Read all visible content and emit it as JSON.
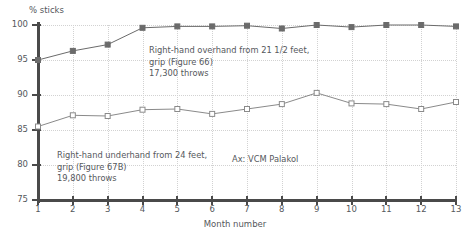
{
  "chart_data": {
    "type": "line",
    "title": "",
    "xlabel": "Month number",
    "ylabel": "% sticks",
    "ylim": [
      75,
      100
    ],
    "xlim": [
      1,
      13
    ],
    "yticks": [
      75,
      80,
      85,
      90,
      95,
      100
    ],
    "xticks": [
      1,
      2,
      3,
      4,
      5,
      6,
      7,
      8,
      9,
      10,
      11,
      12,
      13
    ],
    "grid": true,
    "legend": "none",
    "x": [
      1,
      2,
      3,
      4,
      5,
      6,
      7,
      8,
      9,
      10,
      11,
      12,
      13
    ],
    "series": [
      {
        "name": "Right-hand overhand from 21 1/2 feet",
        "marker": "filled-square",
        "color": "#6b6b6b",
        "values": [
          95.0,
          96.3,
          97.2,
          99.6,
          99.8,
          99.8,
          99.9,
          99.5,
          100.0,
          99.7,
          100.0,
          100.0,
          99.8
        ]
      },
      {
        "name": "Right-hand underhand from 24 feet",
        "marker": "open-square",
        "color": "#8a8a8a",
        "values": [
          85.5,
          87.1,
          87.0,
          87.9,
          88.0,
          87.3,
          88.0,
          88.7,
          90.3,
          88.8,
          88.7,
          88.0,
          89.0
        ]
      }
    ],
    "annotations": [
      {
        "id": "overhand",
        "lines": [
          "Right-hand overhand from 21 1/2 feet,",
          "grip (Figure 66)",
          "17,300 throws"
        ]
      },
      {
        "id": "underhand",
        "lines": [
          "Right-hand underhand from 24 feet,",
          "grip (Figure 67B)",
          "19,800 throws"
        ]
      },
      {
        "id": "axis-note",
        "lines": [
          "Ax: VCM Palakol"
        ]
      }
    ]
  }
}
